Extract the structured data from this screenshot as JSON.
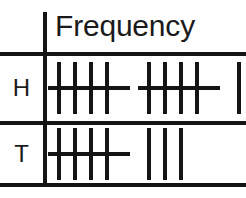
{
  "chart_data": {
    "type": "table",
    "title": "",
    "columns": [
      "",
      "Frequency"
    ],
    "header": "Frequency",
    "categories": [
      "H",
      "T"
    ],
    "values": [
      12,
      8
    ],
    "rows": [
      {
        "label": "H",
        "frequency": 12,
        "bundles": 2,
        "singles": 2
      },
      {
        "label": "T",
        "frequency": 8,
        "bundles": 1,
        "singles": 3
      }
    ],
    "notation": "tally-marks",
    "marks_per_bundle": 5,
    "grid": true,
    "legend": "none"
  },
  "table": {
    "header": {
      "frequency_label": "Frequency"
    },
    "rows": [
      {
        "label": "H",
        "tally_groups": [
          {
            "kind": "bundle",
            "marks": 4,
            "struck": true,
            "count": 5
          },
          {
            "kind": "bundle",
            "marks": 4,
            "struck": true,
            "count": 5
          },
          {
            "kind": "singles",
            "marks": 2,
            "struck": false,
            "count": 2
          }
        ]
      },
      {
        "label": "T",
        "tally_groups": [
          {
            "kind": "bundle",
            "marks": 4,
            "struck": true,
            "count": 5
          },
          {
            "kind": "singles",
            "marks": 3,
            "struck": false,
            "count": 3
          }
        ]
      }
    ]
  },
  "colors": {
    "ink": "#141414",
    "background": "#fefefe"
  }
}
